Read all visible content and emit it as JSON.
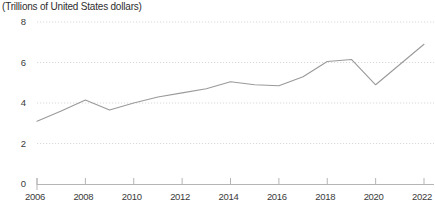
{
  "chart_data": {
    "type": "line",
    "title": "(Trillions of United States dollars)",
    "xlabel": "",
    "ylabel": "",
    "ylim": [
      0,
      8
    ],
    "xlim": [
      2006,
      2022
    ],
    "yticks": [
      0,
      2,
      4,
      6,
      8
    ],
    "ytick_labels": [
      "0",
      "2",
      "4",
      "6",
      "8"
    ],
    "xticks": [
      2006,
      2008,
      2010,
      2012,
      2014,
      2016,
      2018,
      2020,
      2022
    ],
    "xtick_labels": [
      "2006",
      "2008",
      "2010",
      "2012",
      "2014",
      "2016",
      "2018",
      "2020",
      "2022"
    ],
    "x": [
      2006,
      2007,
      2008,
      2009,
      2010,
      2011,
      2012,
      2013,
      2014,
      2015,
      2016,
      2017,
      2018,
      2019,
      2020,
      2021,
      2022
    ],
    "values": [
      3.1,
      3.6,
      4.15,
      3.65,
      4.0,
      4.3,
      4.5,
      4.7,
      5.05,
      4.9,
      4.85,
      5.3,
      6.05,
      6.15,
      4.9,
      5.9,
      6.9
    ],
    "series": [
      {
        "name": "Trillions of United States dollars",
        "values": [
          3.1,
          3.6,
          4.15,
          3.65,
          4.0,
          4.3,
          4.5,
          4.7,
          5.05,
          4.9,
          4.85,
          5.3,
          6.05,
          6.15,
          4.9,
          5.9,
          6.9
        ]
      }
    ],
    "grid": true,
    "grid_style": "dotted-horizontal",
    "legend": false,
    "legend_position": "none",
    "line_color": "#9a9a9a",
    "grid_color": "#d9d9d9",
    "axis_color": "#b5b5b5",
    "text_color": "#3a3a3a",
    "background": "#ffffff"
  }
}
